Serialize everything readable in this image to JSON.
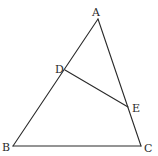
{
  "diagram": {
    "type": "geometry-triangle",
    "stroke_color": "#2a2a2a",
    "points": {
      "A": {
        "label": "A",
        "x": 98,
        "y": 19,
        "lx": 92,
        "ly": 16
      },
      "B": {
        "label": "B",
        "x": 13,
        "y": 146,
        "lx": 2,
        "ly": 151
      },
      "C": {
        "label": "C",
        "x": 141,
        "y": 146,
        "lx": 144,
        "ly": 152
      },
      "D": {
        "label": "D",
        "x": 65,
        "y": 70,
        "lx": 55,
        "ly": 73
      },
      "E": {
        "label": "E",
        "x": 128,
        "y": 107,
        "lx": 132,
        "ly": 112
      }
    },
    "segments": [
      {
        "name": "AB",
        "from": "A",
        "to": "B"
      },
      {
        "name": "AC",
        "from": "A",
        "to": "C"
      },
      {
        "name": "BC",
        "from": "B",
        "to": "C"
      },
      {
        "name": "DE",
        "from": "D",
        "to": "E"
      }
    ],
    "relations": [
      "D lies on AB",
      "E lies on AC"
    ]
  }
}
